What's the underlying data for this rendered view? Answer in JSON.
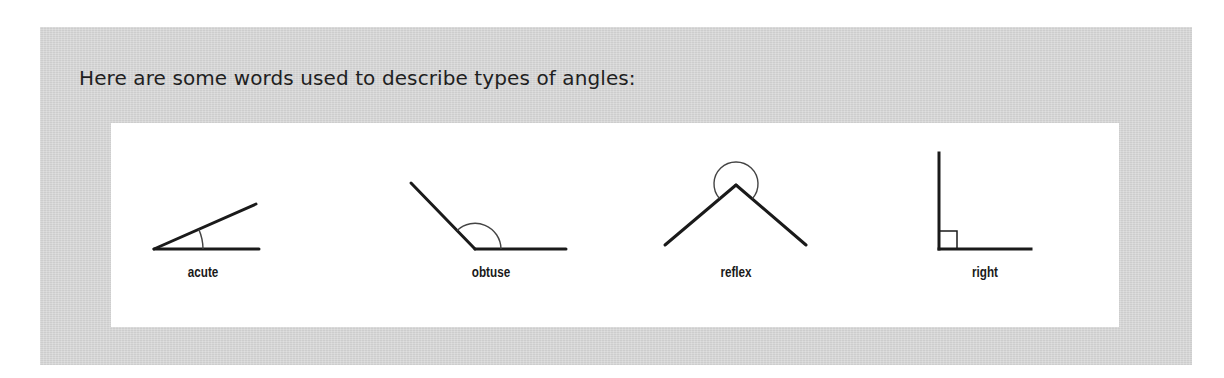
{
  "heading": "Here are some words used to describe types of angles:",
  "colors": {
    "page_background": "#ffffff",
    "box_background": "#d8d8d8",
    "panel_background": "#ffffff",
    "line_color": "#1a1a1a",
    "arc_color": "#444444",
    "text_color": "#1f1f1f"
  },
  "angles": [
    {
      "name": "acute",
      "label": "acute",
      "icon": "acute-angle-icon"
    },
    {
      "name": "obtuse",
      "label": "obtuse",
      "icon": "obtuse-angle-icon"
    },
    {
      "name": "reflex",
      "label": "reflex",
      "icon": "reflex-angle-icon"
    },
    {
      "name": "right",
      "label": "right",
      "icon": "right-angle-icon"
    }
  ]
}
